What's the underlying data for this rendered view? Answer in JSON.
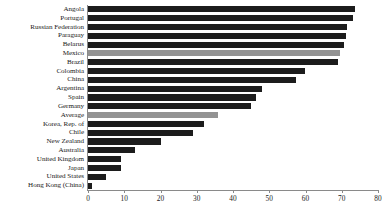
{
  "chart_data": {
    "type": "bar",
    "orientation": "horizontal",
    "title": "",
    "subtitle": "",
    "xlabel": "",
    "ylabel": "",
    "xlim": [
      0,
      80
    ],
    "ylim": null,
    "grid": false,
    "legend": null,
    "xticks": [
      0,
      10,
      20,
      30,
      40,
      50,
      60,
      70,
      80
    ],
    "xtick_labels": [
      "0",
      "10",
      "20",
      "30",
      "40",
      "50",
      "60",
      "70",
      "80"
    ],
    "categories": [
      "Angola",
      "Portugal",
      "Russian Federation",
      "Paraguay",
      "Belarus",
      "Mexico",
      "Brazil",
      "Colombia",
      "China",
      "Argentina",
      "Spain",
      "Germany",
      "Average",
      "Korea, Rep. of",
      "Chile",
      "New Zealand",
      "Australia",
      "United Kingdom",
      "Japan",
      "United States",
      "Hong Kong (China)"
    ],
    "values": [
      73.7,
      73.0,
      71.5,
      71.3,
      70.7,
      69.6,
      69.0,
      59.9,
      57.3,
      47.9,
      46.3,
      44.9,
      35.9,
      32.0,
      29.0,
      20.0,
      13.1,
      9.0,
      9.0,
      5.1,
      1.0
    ],
    "bar_colors": [
      "dark",
      "dark",
      "dark",
      "dark",
      "dark",
      "highlight",
      "dark",
      "dark",
      "dark",
      "dark",
      "dark",
      "dark",
      "highlight",
      "dark",
      "dark",
      "dark",
      "dark",
      "dark",
      "dark",
      "dark",
      "dark"
    ],
    "colors": {
      "dark": "#1c1c1c",
      "highlight": "#939393",
      "axis": "#8a8a8a",
      "background": "#ffffff",
      "text": "#1a1a1a"
    }
  }
}
